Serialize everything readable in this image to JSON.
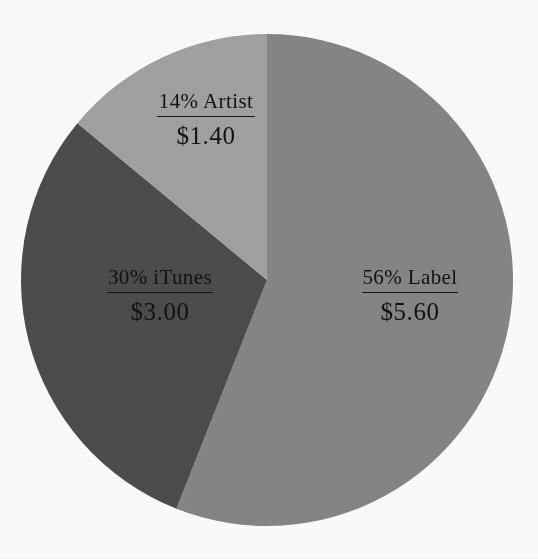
{
  "chart_data": {
    "type": "pie",
    "title": "",
    "subtitle": "",
    "xlabel": "",
    "ylabel": "",
    "legend_position": "none",
    "grid": false,
    "total_value": 10.0,
    "currency_symbol": "$",
    "start_angle_deg": 0,
    "direction": "clockwise",
    "categories": [
      "Label",
      "iTunes",
      "Artist"
    ],
    "values": [
      56,
      30,
      14
    ],
    "value_unit": "percent",
    "amounts": [
      5.6,
      3.0,
      1.4
    ],
    "slices": [
      {
        "name": "Label",
        "percent": 56,
        "percent_text": "56%",
        "title": "56% Label",
        "amount": 5.6,
        "amount_text": "$5.60",
        "color": "#878787"
      },
      {
        "name": "iTunes",
        "percent": 30,
        "percent_text": "30%",
        "title": "30% iTunes",
        "amount": 3.0,
        "amount_text": "$3.00",
        "color": "#4d4d4d"
      },
      {
        "name": "Artist",
        "percent": 14,
        "percent_text": "14%",
        "title": "14% Artist",
        "amount": 1.4,
        "amount_text": "$1.40",
        "color": "#a3a3a3"
      }
    ]
  },
  "figure": {
    "background_color": "#ffffff",
    "text_color": "#15110e",
    "center_x": 267,
    "center_y": 280,
    "radius": 246
  },
  "labels": {
    "artist": {
      "title": "14% Artist",
      "amount": "$1.40"
    },
    "itunes": {
      "title": "30% iTunes",
      "amount": "$3.00"
    },
    "label": {
      "title": "56% Label",
      "amount": "$5.60"
    }
  }
}
